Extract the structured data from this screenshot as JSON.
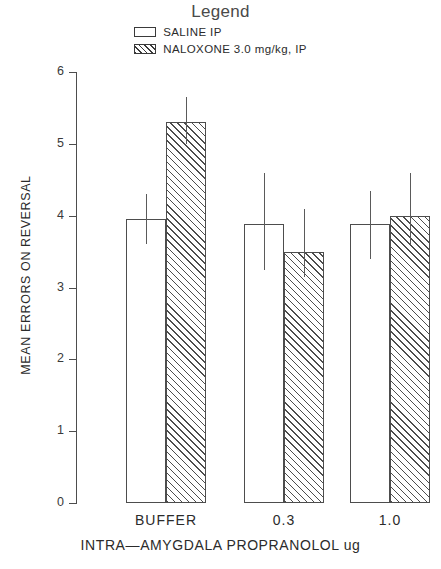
{
  "legend": {
    "title": "Legend",
    "entries": [
      {
        "label": "SALINE IP",
        "swatch": "open-rect-icon"
      },
      {
        "label": "NALOXONE 3.0 mg/kg, IP",
        "swatch": "hatched-rect-icon"
      }
    ]
  },
  "chart_data": {
    "type": "bar",
    "title": "",
    "xlabel": "INTRA—AMYGDALA PROPRANOLOL ug",
    "ylabel": "MEAN ERRORS ON REVERSAL",
    "categories": [
      "BUFFER",
      "0.3",
      "1.0"
    ],
    "ylim": [
      0,
      6
    ],
    "yticks": [
      0,
      1,
      2,
      3,
      4,
      5,
      6
    ],
    "ytick_labels": [
      "0",
      "1",
      "2",
      "3",
      "4",
      "5",
      "6"
    ],
    "grid": false,
    "legend_position": "top-center",
    "series": [
      {
        "name": "SALINE IP",
        "fill": "open",
        "values": [
          3.95,
          3.88,
          3.88
        ],
        "errors_low": [
          3.6,
          3.25,
          3.4
        ],
        "errors_high": [
          4.3,
          4.6,
          4.35
        ]
      },
      {
        "name": "NALOXONE 3.0 mg/kg, IP",
        "fill": "hatched",
        "values": [
          5.3,
          3.5,
          4.0
        ],
        "errors_low": [
          5.0,
          3.15,
          3.6
        ],
        "errors_high": [
          5.65,
          4.1,
          4.6
        ]
      }
    ]
  },
  "colors": {
    "axis": "#4d4d4d",
    "text": "#2b2b2b",
    "background": "#ffffff"
  }
}
